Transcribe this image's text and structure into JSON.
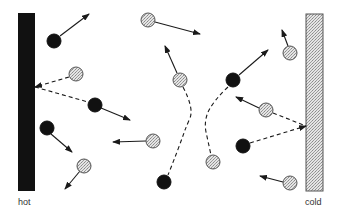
{
  "labels": {
    "hot": "hot",
    "cold": "cold"
  },
  "colors": {
    "hot_wall": "#111111",
    "cold_wall": "#d6d6d6",
    "hot_particle": "#111111",
    "cold_particle": "#d4d4d4",
    "line": "#1a1a1a"
  },
  "walls": {
    "hot": {
      "x": 18,
      "y": 13,
      "w": 17,
      "h": 178
    },
    "cold": {
      "x": 306,
      "y": 14,
      "w": 17,
      "h": 177
    }
  },
  "particles": [
    {
      "type": "hot",
      "cx": 54,
      "cy": 41
    },
    {
      "type": "cold",
      "cx": 76,
      "cy": 74
    },
    {
      "type": "hot",
      "cx": 95,
      "cy": 105
    },
    {
      "type": "hot",
      "cx": 47,
      "cy": 128
    },
    {
      "type": "cold",
      "cx": 84,
      "cy": 166
    },
    {
      "type": "cold",
      "cx": 148,
      "cy": 20
    },
    {
      "type": "cold",
      "cx": 180,
      "cy": 80
    },
    {
      "type": "cold",
      "cx": 153,
      "cy": 141
    },
    {
      "type": "hot",
      "cx": 164,
      "cy": 182
    },
    {
      "type": "hot",
      "cx": 233,
      "cy": 80
    },
    {
      "type": "cold",
      "cx": 213,
      "cy": 162
    },
    {
      "type": "cold",
      "cx": 290,
      "cy": 53
    },
    {
      "type": "cold",
      "cx": 266,
      "cy": 110
    },
    {
      "type": "hot",
      "cx": 243,
      "cy": 146
    },
    {
      "type": "cold",
      "cx": 290,
      "cy": 183
    }
  ],
  "arrows": [
    {
      "x1": 60,
      "y1": 36,
      "x2": 89,
      "y2": 14,
      "dashed": false
    },
    {
      "x1": 101,
      "y1": 108,
      "x2": 130,
      "y2": 120,
      "dashed": false
    },
    {
      "x1": 51,
      "y1": 134,
      "x2": 72,
      "y2": 152,
      "dashed": false
    },
    {
      "x1": 80,
      "y1": 171,
      "x2": 65,
      "y2": 189,
      "dashed": false
    },
    {
      "x1": 155,
      "y1": 22,
      "x2": 200,
      "y2": 34,
      "dashed": false
    },
    {
      "x1": 177,
      "y1": 73,
      "x2": 165,
      "y2": 46,
      "dashed": false
    },
    {
      "x1": 146,
      "y1": 141,
      "x2": 113,
      "y2": 142,
      "dashed": false
    },
    {
      "x1": 239,
      "y1": 75,
      "x2": 268,
      "y2": 50,
      "dashed": false
    },
    {
      "x1": 288,
      "y1": 46,
      "x2": 282,
      "y2": 30,
      "dashed": false
    },
    {
      "x1": 259,
      "y1": 108,
      "x2": 236,
      "y2": 97,
      "dashed": false
    },
    {
      "x1": 283,
      "y1": 182,
      "x2": 260,
      "y2": 176,
      "dashed": false
    },
    {
      "x1": 69,
      "y1": 77,
      "x2": 35,
      "y2": 87,
      "dashed": true
    },
    {
      "x1": 250,
      "y1": 143,
      "x2": 306,
      "y2": 126,
      "dashed": true
    }
  ],
  "dashed_paths": [
    "M35,87 L88,102",
    "M273,113 L306,126",
    "M183,87 Q194,108 190,118 Q187,125 185,130 Q178,150 168,175",
    "M228,87 Q214,100 208,112 Q204,122 206,132 L211,155"
  ]
}
